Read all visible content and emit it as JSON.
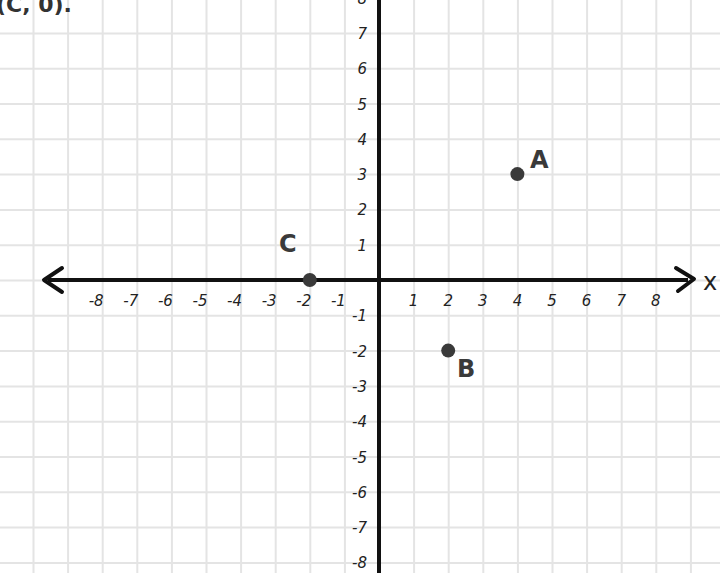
{
  "caption_fragment": "(C,  0).",
  "chart_data": {
    "type": "scatter",
    "title": "",
    "xlabel": "x",
    "ylabel": "",
    "xlim": [
      -8,
      8
    ],
    "ylim": [
      -8,
      8
    ],
    "grid": true,
    "x_ticks": [
      "-8",
      "-7",
      "-6",
      "-5",
      "-4",
      "-3",
      "-2",
      "-1",
      "1",
      "2",
      "3",
      "4",
      "5",
      "6",
      "7",
      "8"
    ],
    "y_ticks": [
      "8",
      "7",
      "6",
      "5",
      "4",
      "3",
      "2",
      "1",
      "-1",
      "-2",
      "-3",
      "-4",
      "-5",
      "-6",
      "-7",
      "-8"
    ],
    "points": [
      {
        "label": "A",
        "x": 4,
        "y": 3
      },
      {
        "label": "B",
        "x": 2,
        "y": -2
      },
      {
        "label": "C",
        "x": -2,
        "y": 0
      }
    ]
  },
  "colors": {
    "axis": "#111111",
    "grid": "#e4e4e4",
    "point": "#3a3a3a"
  }
}
